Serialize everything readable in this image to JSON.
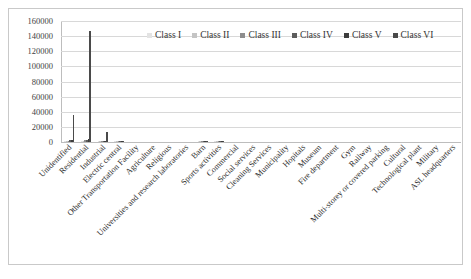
{
  "chart_data": {
    "type": "bar",
    "title": "",
    "subtitle": "",
    "xlabel": "",
    "ylabel": "",
    "ylim": [
      0,
      160000
    ],
    "ytick_labels": [
      "160000",
      "140000",
      "120000",
      "100000",
      "80000",
      "60000",
      "40000",
      "20000",
      "0"
    ],
    "ytick_values": [
      160000,
      140000,
      120000,
      100000,
      80000,
      60000,
      40000,
      20000,
      0
    ],
    "grid": true,
    "legend_position": "top-center",
    "orientation": "vertical",
    "bar_mode": "grouped",
    "categories": [
      "Unidentified",
      "Residential",
      "Industrial",
      "Electric central",
      "Other Transportation Facility",
      "Agriculture",
      "Religious",
      "Universities and research laboratories",
      "Barn",
      "Sports activities",
      "Commercial",
      "Social services",
      "Cleaning Services",
      "Municipality",
      "Hopitals",
      "Museum",
      "Fire department",
      "Gym",
      "Railway",
      "Multi-storey or covered parking",
      "Cultural",
      "Technological plant",
      "Military",
      "ASL headquarters"
    ],
    "series": [
      {
        "name": "Class I",
        "color": "#e3e3e3",
        "values": [
          900,
          1100,
          300,
          60,
          0,
          0,
          0,
          0,
          150,
          140,
          0,
          0,
          0,
          0,
          0,
          0,
          0,
          0,
          0,
          0,
          0,
          0,
          0,
          0
        ]
      },
      {
        "name": "Class II",
        "color": "#c4c4c4",
        "values": [
          1500,
          1800,
          500,
          80,
          0,
          0,
          0,
          0,
          170,
          160,
          0,
          0,
          0,
          0,
          0,
          0,
          0,
          0,
          0,
          0,
          0,
          0,
          0,
          0
        ]
      },
      {
        "name": "Class III",
        "color": "#8d8d8d",
        "values": [
          2000,
          2400,
          700,
          100,
          0,
          0,
          0,
          0,
          190,
          180,
          0,
          0,
          0,
          0,
          0,
          0,
          0,
          0,
          0,
          0,
          0,
          0,
          0,
          0
        ]
      },
      {
        "name": "Class IV",
        "color": "#5c5c5c",
        "values": [
          2600,
          3000,
          900,
          120,
          0,
          0,
          0,
          0,
          210,
          200,
          0,
          0,
          0,
          0,
          0,
          0,
          0,
          0,
          0,
          0,
          0,
          0,
          0,
          0
        ]
      },
      {
        "name": "Class V",
        "color": "#3d3d3d",
        "values": [
          3200,
          3600,
          1100,
          140,
          0,
          0,
          0,
          0,
          230,
          220,
          0,
          0,
          0,
          0,
          0,
          0,
          0,
          0,
          0,
          0,
          0,
          0,
          0,
          0
        ]
      },
      {
        "name": "Class VI",
        "color": "#4a4a4a",
        "values": [
          36000,
          147000,
          13000,
          900,
          0,
          0,
          0,
          0,
          900,
          900,
          0,
          0,
          0,
          0,
          0,
          0,
          0,
          0,
          0,
          0,
          0,
          0,
          0,
          0
        ]
      }
    ],
    "totals_note": "Bars are dominated by the tallest class; rendered as a single visible column per category.",
    "visible_bar_values": [
      36000,
      147000,
      13000,
      900,
      0,
      0,
      0,
      0,
      900,
      900,
      0,
      0,
      0,
      0,
      0,
      0,
      0,
      0,
      0,
      0,
      0,
      0,
      0,
      0
    ],
    "visible_bar_color": "#4a4a4a"
  },
  "legend": {
    "items": [
      {
        "label": "Class I",
        "color": "#e3e3e3"
      },
      {
        "label": "Class II",
        "color": "#c4c4c4"
      },
      {
        "label": "Class III",
        "color": "#8d8d8d"
      },
      {
        "label": "Class IV",
        "color": "#5c5c5c"
      },
      {
        "label": "Class V",
        "color": "#3d3d3d"
      },
      {
        "label": "Class VI",
        "color": "#4a4a4a"
      }
    ]
  }
}
